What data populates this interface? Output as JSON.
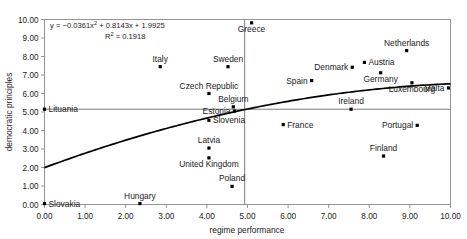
{
  "chart_data": {
    "type": "scatter",
    "title": "",
    "xlabel": "regime performance",
    "ylabel": "democratic principles",
    "xlim": [
      0,
      10
    ],
    "ylim": [
      0,
      10
    ],
    "xticks": [
      "0.00",
      "1.00",
      "2.00",
      "3.00",
      "4.00",
      "5.00",
      "6.00",
      "7.00",
      "8.00",
      "9.00",
      "10.00"
    ],
    "yticks": [
      "0.00",
      "1.00",
      "2.00",
      "3.00",
      "4.00",
      "5.00",
      "6.00",
      "7.00",
      "8.00",
      "9.00",
      "10.00"
    ],
    "grid": false,
    "legend": "none",
    "annotations": {
      "equation": "y = −0.0361x2 + 0.8143x + 1.9925",
      "equation_plain": "y = -0.0361x^2 + 0.8143x + 1.9925",
      "r_squared": "R2 = 0.1918",
      "r_squared_plain": "R2 = 0.1918"
    },
    "trendline": {
      "kind": "quadratic",
      "a": -0.0361,
      "b": 0.8143,
      "c": 1.9925
    },
    "reference_lines": {
      "horizontal_y": 5.15,
      "vertical_x": 4.93
    },
    "points": [
      {
        "label": "Lituania",
        "x": 0.0,
        "y": 5.15,
        "label_pos": "right"
      },
      {
        "label": "Slovakia",
        "x": 0.0,
        "y": 0.05,
        "label_pos": "right"
      },
      {
        "label": "Hungary",
        "x": 2.35,
        "y": 0.05,
        "label_pos": "above"
      },
      {
        "label": "Italy",
        "x": 2.85,
        "y": 7.45,
        "label_pos": "above"
      },
      {
        "label": "Sweden",
        "x": 4.52,
        "y": 7.45,
        "label_pos": "above"
      },
      {
        "label": "Czech Republic",
        "x": 4.05,
        "y": 6.0,
        "label_pos": "above"
      },
      {
        "label": "Belgium",
        "x": 4.65,
        "y": 5.28,
        "label_pos": "above"
      },
      {
        "label": "Estonia",
        "x": 4.68,
        "y": 5.05,
        "label_pos": "left"
      },
      {
        "label": "Slovenia",
        "x": 4.05,
        "y": 4.55,
        "label_pos": "right"
      },
      {
        "label": "Latvia",
        "x": 4.05,
        "y": 3.05,
        "label_pos": "above"
      },
      {
        "label": "United Kingdom",
        "x": 4.05,
        "y": 2.52,
        "label_pos": "below"
      },
      {
        "label": "Poland",
        "x": 4.62,
        "y": 0.98,
        "label_pos": "above"
      },
      {
        "label": "Greece",
        "x": 5.1,
        "y": 9.82,
        "label_pos": "below"
      },
      {
        "label": "Spain",
        "x": 6.58,
        "y": 6.7,
        "label_pos": "left"
      },
      {
        "label": "Denmark",
        "x": 7.58,
        "y": 7.42,
        "label_pos": "left"
      },
      {
        "label": "Austria",
        "x": 7.88,
        "y": 7.68,
        "label_pos": "right"
      },
      {
        "label": "Germany",
        "x": 8.28,
        "y": 7.12,
        "label_pos": "below"
      },
      {
        "label": "Netherlands",
        "x": 8.92,
        "y": 8.32,
        "label_pos": "above"
      },
      {
        "label": "Luxembourg",
        "x": 9.05,
        "y": 6.58,
        "label_pos": "below"
      },
      {
        "label": "Malta",
        "x": 9.95,
        "y": 6.3,
        "label_pos": "left"
      },
      {
        "label": "Ireland",
        "x": 7.55,
        "y": 5.15,
        "label_pos": "above"
      },
      {
        "label": "France",
        "x": 5.88,
        "y": 4.32,
        "label_pos": "right"
      },
      {
        "label": "Portugal",
        "x": 9.18,
        "y": 4.28,
        "label_pos": "left"
      },
      {
        "label": "Finland",
        "x": 8.35,
        "y": 2.62,
        "label_pos": "above"
      }
    ]
  }
}
